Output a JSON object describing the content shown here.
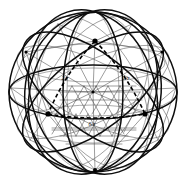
{
  "figure": {
    "kind": "line-drawing",
    "background_color": "#ffffff",
    "ink_color": "#000000",
    "light_ink_color": "#555555",
    "canvas": {
      "width": 185,
      "height": 186
    }
  },
  "sphere": {
    "center_x": 93,
    "center_y": 92,
    "radius_x": 84,
    "radius_y": 80,
    "outline_color": "#1a1a1a",
    "outline_width": 1.6
  },
  "nodes": [
    {
      "name": "apex-node",
      "x": 95,
      "y": 41,
      "radius": 2.4
    },
    {
      "name": "left-node",
      "x": 48,
      "y": 114,
      "radius": 2.4
    },
    {
      "name": "right-node",
      "x": 145,
      "y": 114,
      "radius": 2.4
    },
    {
      "name": "bottom-node",
      "x": 95,
      "y": 170,
      "radius": 2.0
    },
    {
      "name": "upper-left-node",
      "x": 26,
      "y": 52,
      "radius": 1.8
    },
    {
      "name": "upper-right-node",
      "x": 162,
      "y": 52,
      "radius": 1.8
    }
  ],
  "dashed_triangle": {
    "name": "spherical-triangle",
    "stroke_color": "#000000",
    "stroke_width": 1.5,
    "dash_pattern": "4 2.5",
    "vertices": [
      {
        "x": 95,
        "y": 41
      },
      {
        "x": 48,
        "y": 114
      },
      {
        "x": 145,
        "y": 114
      }
    ]
  },
  "labels": [
    {
      "name": "left-edge-label",
      "text": "2/r",
      "x": 65,
      "y": 80
    },
    {
      "name": "right-edge-label",
      "text": "1/r",
      "x": 126,
      "y": 80
    },
    {
      "name": "base-edge-label",
      "text": "6/r",
      "x": 92,
      "y": 126
    }
  ],
  "legend": {
    "heavy_circle_note": "great circles",
    "mesh_note": "geodesic subdivision"
  }
}
